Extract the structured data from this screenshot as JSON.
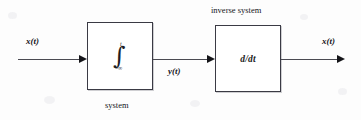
{
  "diagram": {
    "blocks": [
      {
        "id": "integrator",
        "label": "∫",
        "integral_upper_limit": "t",
        "integral_lower_limit": "−∞",
        "caption": "system"
      },
      {
        "id": "differentiator",
        "label": "d/dt",
        "caption": "inverse system"
      }
    ],
    "signals": {
      "input": "x(t)",
      "intermediate": "y(t)",
      "output": "x(t)"
    },
    "captions": {
      "system": "system",
      "inverse_system": "inverse system"
    },
    "colors": {
      "background": "#fdfdfd",
      "stroke": "#3a3a44",
      "arrow": "#151519",
      "text": "#16161c"
    }
  }
}
